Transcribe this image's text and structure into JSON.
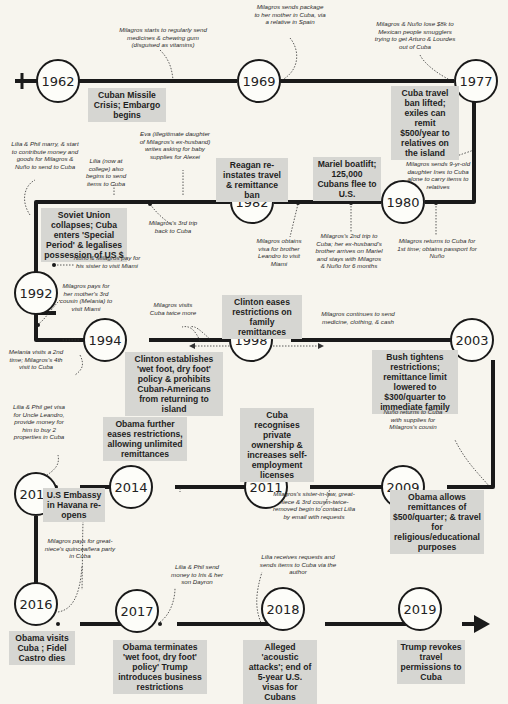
{
  "diagram": {
    "type": "timeline",
    "title": "",
    "nodes": [
      {
        "year": "1962",
        "x": 42,
        "y": 61
      },
      {
        "year": "1969",
        "x": 237,
        "y": 61
      },
      {
        "year": "1977",
        "x": 454,
        "y": 61
      },
      {
        "year": "1980",
        "x": 381,
        "y": 181
      },
      {
        "year": "1982",
        "x": 230,
        "y": 198
      },
      {
        "year": "1992",
        "x": 36,
        "y": 273
      },
      {
        "year": "1994",
        "x": 105,
        "y": 320
      },
      {
        "year": "1998",
        "x": 247,
        "y": 320
      },
      {
        "year": "2003",
        "x": 472,
        "y": 320
      },
      {
        "year": "2009",
        "x": 403,
        "y": 467
      },
      {
        "year": "2011",
        "x": 266,
        "y": 467
      },
      {
        "year": "2014",
        "x": 131,
        "y": 467
      },
      {
        "year": "2015",
        "x": 36,
        "y": 472
      },
      {
        "year": "2016",
        "x": 36,
        "y": 604
      },
      {
        "year": "2017",
        "x": 133,
        "y": 611
      },
      {
        "year": "2018",
        "x": 281,
        "y": 609
      },
      {
        "year": "2019",
        "x": 418,
        "y": 609
      }
    ],
    "events": [
      {
        "id": "e1962",
        "text": "Cuban Missile Crisis; Embargo begins"
      },
      {
        "id": "e1977",
        "text": "Cuba travel ban lifted; exiles can remit $500/year to relatives on the island"
      },
      {
        "id": "e1980",
        "text": "Mariel boatlift; 125,000 Cubans flee to U.S."
      },
      {
        "id": "e1982",
        "text": "Reagan re-instates travel & remittance ban"
      },
      {
        "id": "e1992",
        "text": "Soviet Union collapses; Cuba enters 'Special Period' & legalises possession of US $"
      },
      {
        "id": "e1994",
        "text": "Clinton establishes 'wet foot, dry foot' policy & prohibits Cuban-Americans from returning to island"
      },
      {
        "id": "e1998",
        "text": "Clinton eases restrictions on family remittances"
      },
      {
        "id": "e2003",
        "text": "Bush tightens restrictions; remittance limit lowered to $300/quarter to immediate family"
      },
      {
        "id": "e2009",
        "text": "Obama allows remittances of $500/quarter; & travel for religious/educational purposes"
      },
      {
        "id": "e2011",
        "text": "Cuba recognises private ownership & increases self-employment licenses"
      },
      {
        "id": "e2014",
        "text": "Obama further eases restrictions, allowing unlimited remittances"
      },
      {
        "id": "e2015",
        "text": "U.S Embassy in Havana re-opens"
      },
      {
        "id": "e2016",
        "text": "Obama visits Cuba ; Fidel Castro dies"
      },
      {
        "id": "e2017",
        "text": "Obama terminates 'wet foot, dry foot' policy' Trump introduces business restrictions"
      },
      {
        "id": "e2018",
        "text": "Alleged 'acoustic attacks'; end of 5-year U.S. visas for Cubans"
      },
      {
        "id": "e2019",
        "text": "Trump revokes travel permissions to Cuba"
      }
    ],
    "notes": [
      {
        "id": "n1",
        "text": "Milagros starts to regularly send medicines & chewing gum (disguised as vitamins)"
      },
      {
        "id": "n2",
        "text": "Milagros sends package to her mother in Cuba, via a relative in Spain"
      },
      {
        "id": "n3",
        "text": "Milagros & Nuño lose $8k to Mexican people smugglers trying to get Arturo & Lourdes out of Cuba"
      },
      {
        "id": "n4",
        "text": "Milagros sends 9-yr-old daughter Ines to Cuba alone to carry items to relatives"
      },
      {
        "id": "n5",
        "text": "Milagros returns to Cuba for 1st time; obtains passport for Nuño"
      },
      {
        "id": "n6",
        "text": "Milagros's 2nd trip to Cuba; her ex-husband's brother arrives on Mariel and stays with Milagros & Nuño for 6 months"
      },
      {
        "id": "n7",
        "text": "Milagros obtains visa for brother Leandro to visit Miami"
      },
      {
        "id": "n8",
        "text": "Eva (illegitimate daughter of Milagros's ex-husband) writes asking for baby supplies for Alexei"
      },
      {
        "id": "n9",
        "text": "Lilia (now at college) also begins to send items to Cuba"
      },
      {
        "id": "n10",
        "text": "Lilia & Phil marry, & start to contribute money and goods for Milagros & Nuño to send to Cuba"
      },
      {
        "id": "n11",
        "text": "Milagros's 3rd trip back to Cuba"
      },
      {
        "id": "n12",
        "text": "Nuño & Milagros pay for his sister to visit Miami"
      },
      {
        "id": "n13",
        "text": "Milagros pays for her mother's 3rd cousin (Melania) to visit Miami"
      },
      {
        "id": "n14",
        "text": "Milagros visits Cuba twice more"
      },
      {
        "id": "n15",
        "text": "Melania visits a 2nd time; Milagros's 4th visit to Cuba"
      },
      {
        "id": "n16",
        "text": "Milagros continues to send medicine, clothing, & cash"
      },
      {
        "id": "n17",
        "text": "Nuño returns to Cuba with supplies for Milagros's cousin"
      },
      {
        "id": "n18",
        "text": "Milagros's sister-in-law, great-niece & 3rd cousin-twice-removed begin to contact Lilia by email with requests"
      },
      {
        "id": "n19",
        "text": "Lilia & Phil get visa for Uncle Leandro, provide money for him to buy 2 properties in Cuba"
      },
      {
        "id": "n20",
        "text": "Milagros pays for great-niece's quinceañera party in Cuba"
      },
      {
        "id": "n21",
        "text": "Lilia & Phil send money to Iris & her son Dayron"
      },
      {
        "id": "n22",
        "text": "Lilia receives requests and sends items to Cuba via the author"
      }
    ],
    "colors": {
      "background": "#f7f5ee",
      "line": "#1a1a1a",
      "event_box": "#d6d6d2"
    }
  }
}
